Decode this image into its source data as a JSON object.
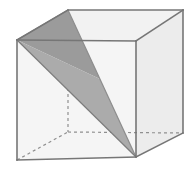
{
  "figure": {
    "description": "Line drawing of a cube in oblique projection with hidden edges dashed and an interior triangular plane shaded in two gray tones.",
    "canvas": {
      "width": 194,
      "height": 170,
      "background": "#ffffff"
    },
    "colors": {
      "front_face": "#f5f5f5",
      "top_face": "#f2f2f2",
      "right_face": "#ececec",
      "triangle_dark": "#9b9b9b",
      "triangle_light": "#ababab",
      "edge_stroke": "#767676",
      "hidden_stroke": "#8f8f8f",
      "outline_stroke": "#6e6e6e"
    },
    "stroke_widths": {
      "visible_edge": 1.6,
      "hidden_edge": 1.2,
      "triangle_edge": 1.2
    },
    "hidden_edge_dash": "3,3",
    "vertices": {
      "front_top_left": [
        17,
        40
      ],
      "front_top_right": [
        136,
        41
      ],
      "front_bottom_right": [
        136,
        157
      ],
      "front_bottom_left": [
        17,
        160
      ],
      "back_top_left": [
        68,
        10
      ],
      "back_top_right": [
        183,
        10
      ],
      "back_bottom_right": [
        183,
        133
      ],
      "back_bottom_left": [
        68,
        132
      ]
    },
    "faces": [
      {
        "name": "front-face",
        "points": "17,40 136,41 136,157 17,160",
        "fill": "#f5f5f5"
      },
      {
        "name": "top-face",
        "points": "17,40 68,10 183,10 136,41",
        "fill": "#f2f2f2"
      },
      {
        "name": "right-face",
        "points": "136,41 183,10 183,133 136,157",
        "fill": "#ececec"
      }
    ],
    "shaded_triangle": {
      "name": "triangular-cross-section",
      "vertices": [
        [
          17,
          40
        ],
        [
          68,
          10
        ],
        [
          136,
          157
        ]
      ],
      "dark_half": "17,40 68,10 136,157",
      "light_half": "68,10 136,157 17,40",
      "fold_line": [
        [
          68,
          10
        ],
        [
          136,
          157
        ]
      ],
      "left_edge": [
        [
          17,
          40
        ],
        [
          68,
          10
        ]
      ],
      "lower_left_edge": [
        [
          17,
          40
        ],
        [
          136,
          157
        ]
      ]
    },
    "visible_edges": [
      {
        "name": "edge-front-top",
        "from": [
          17,
          40
        ],
        "to": [
          136,
          41
        ]
      },
      {
        "name": "edge-front-right",
        "from": [
          136,
          41
        ],
        "to": [
          136,
          157
        ]
      },
      {
        "name": "edge-front-bottom",
        "from": [
          17,
          160
        ],
        "to": [
          136,
          157
        ]
      },
      {
        "name": "edge-front-left",
        "from": [
          17,
          40
        ],
        "to": [
          17,
          160
        ]
      },
      {
        "name": "edge-top-left-diagonal",
        "from": [
          17,
          40
        ],
        "to": [
          68,
          10
        ]
      },
      {
        "name": "edge-top-back",
        "from": [
          68,
          10
        ],
        "to": [
          183,
          10
        ]
      },
      {
        "name": "edge-top-right-diagonal",
        "from": [
          136,
          41
        ],
        "to": [
          183,
          10
        ]
      },
      {
        "name": "edge-back-right",
        "from": [
          183,
          10
        ],
        "to": [
          183,
          133
        ]
      },
      {
        "name": "edge-bottom-right-diagonal",
        "from": [
          136,
          157
        ],
        "to": [
          183,
          133
        ]
      }
    ],
    "hidden_edges": [
      {
        "name": "hidden-edge-back-left-vertical",
        "from": [
          68,
          10
        ],
        "to": [
          68,
          132
        ]
      },
      {
        "name": "hidden-edge-bottom-back",
        "from": [
          68,
          132
        ],
        "to": [
          183,
          133
        ]
      },
      {
        "name": "hidden-edge-bottom-left-diagonal",
        "from": [
          17,
          160
        ],
        "to": [
          68,
          132
        ]
      }
    ]
  }
}
